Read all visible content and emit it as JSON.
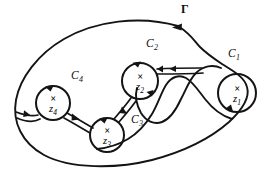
{
  "figure": {
    "outer_contour_label": "Γ",
    "stroke_color": "#141414",
    "background_color": "#ffffff",
    "width": 273,
    "height": 174
  },
  "outer_contour": {
    "name": "Gamma",
    "label": "Γ",
    "label_x": 181,
    "label_y": 4,
    "direction": "counterclockwise",
    "arrow_at": {
      "x": 178,
      "y": 26,
      "heading": "left"
    }
  },
  "inner_contours": [
    {
      "id": "C1",
      "letter": "C",
      "subscript": "1",
      "label_x": 228,
      "label_y": 49,
      "center_x": 237,
      "center_y": 93,
      "radius": 19,
      "pole_letter": "×",
      "pole_variable": "z",
      "pole_subscript": "1",
      "pole_x": 237,
      "pole_y": 86,
      "direction": "clockwise"
    },
    {
      "id": "C2",
      "letter": "C",
      "subscript": "2",
      "label_x": 146,
      "label_y": 39,
      "center_x": 140,
      "center_y": 81,
      "radius": 18,
      "pole_letter": "×",
      "pole_variable": "z",
      "pole_subscript": "2",
      "pole_x": 140,
      "pole_y": 74,
      "direction": "clockwise"
    },
    {
      "id": "C3",
      "letter": "C",
      "subscript": "3",
      "label_x": 131,
      "label_y": 115,
      "center_x": 107,
      "center_y": 135,
      "radius": 17,
      "pole_letter": "×",
      "pole_variable": "z",
      "pole_subscript": "3",
      "pole_x": 107,
      "pole_y": 129,
      "direction": "clockwise"
    },
    {
      "id": "C4",
      "letter": "C",
      "subscript": "4",
      "label_x": 71,
      "label_y": 71,
      "center_x": 53,
      "center_y": 103,
      "radius": 17,
      "pole_letter": "×",
      "pole_variable": "z",
      "pole_subscript": "4",
      "pole_x": 53,
      "pole_y": 97,
      "direction": "clockwise"
    }
  ],
  "cuts": [
    {
      "id": "cut-outer-to-C4",
      "from": "outer boundary",
      "to": "C4"
    },
    {
      "id": "cut-C4-to-C3",
      "from": "C4",
      "to": "C3"
    },
    {
      "id": "cut-C3-to-C2",
      "from": "C3",
      "to": "C2"
    },
    {
      "id": "cut-C2-to-C1",
      "from": "C2",
      "to": "C1"
    }
  ]
}
